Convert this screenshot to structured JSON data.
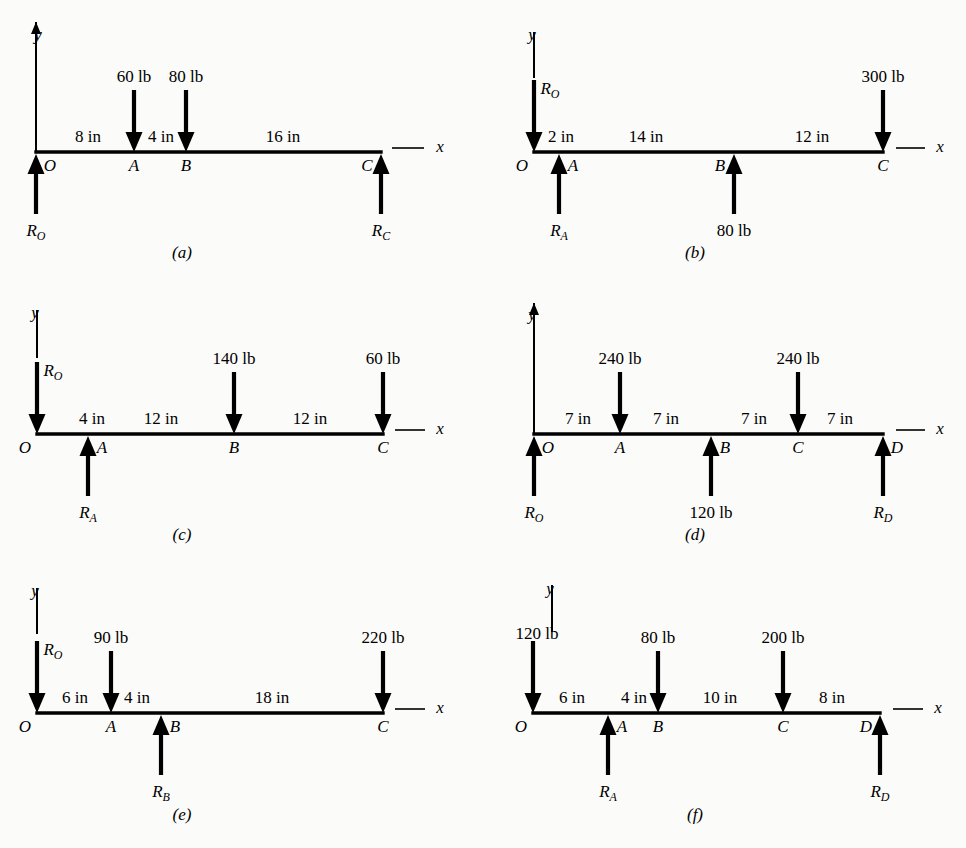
{
  "figure": {
    "type": "free-body-diagram-set",
    "ink_color": "#000000",
    "paper_color": "#fbfbf9"
  },
  "axis_labels": {
    "y": "y",
    "x": "x"
  },
  "units": {
    "length": "in",
    "force": "lb"
  },
  "panels": [
    {
      "caption": "(a)",
      "y_axis_style": "solid",
      "points": [
        "O",
        "A",
        "B",
        "C"
      ],
      "dimensions": [
        "8 in",
        "4 in",
        "16 in"
      ],
      "forces": [
        {
          "at": "O",
          "label": "R",
          "sub": "O",
          "dir": "up",
          "kind": "reaction"
        },
        {
          "at": "A",
          "label": "60 lb",
          "dir": "down",
          "kind": "load"
        },
        {
          "at": "B",
          "label": "80 lb",
          "dir": "down",
          "kind": "load"
        },
        {
          "at": "C",
          "label": "R",
          "sub": "C",
          "dir": "up",
          "kind": "reaction"
        }
      ]
    },
    {
      "caption": "(b)",
      "y_axis_style": "broken",
      "points": [
        "O",
        "A",
        "B",
        "C"
      ],
      "dimensions": [
        "2 in",
        "14 in",
        "12 in"
      ],
      "forces": [
        {
          "at": "O",
          "label": "R",
          "sub": "O",
          "dir": "down",
          "kind": "reaction"
        },
        {
          "at": "A",
          "label": "R",
          "sub": "A",
          "dir": "up",
          "kind": "reaction"
        },
        {
          "at": "B",
          "label": "80 lb",
          "dir": "up",
          "kind": "load"
        },
        {
          "at": "C",
          "label": "300 lb",
          "dir": "down",
          "kind": "load"
        }
      ]
    },
    {
      "caption": "(c)",
      "y_axis_style": "broken",
      "points": [
        "O",
        "A",
        "B",
        "C"
      ],
      "dimensions": [
        "4 in",
        "12 in",
        "12 in"
      ],
      "forces": [
        {
          "at": "O",
          "label": "R",
          "sub": "O",
          "dir": "down",
          "kind": "reaction"
        },
        {
          "at": "A",
          "label": "R",
          "sub": "A",
          "dir": "up",
          "kind": "reaction"
        },
        {
          "at": "B",
          "label": "140 lb",
          "dir": "down",
          "kind": "load"
        },
        {
          "at": "C",
          "label": "60 lb",
          "dir": "down",
          "kind": "load"
        }
      ]
    },
    {
      "caption": "(d)",
      "y_axis_style": "solid",
      "points": [
        "O",
        "A",
        "B",
        "C",
        "D"
      ],
      "dimensions": [
        "7 in",
        "7 in",
        "7 in",
        "7 in"
      ],
      "forces": [
        {
          "at": "O",
          "label": "R",
          "sub": "O",
          "dir": "up",
          "kind": "reaction"
        },
        {
          "at": "A",
          "label": "240 lb",
          "dir": "down",
          "kind": "load"
        },
        {
          "at": "B",
          "label": "120 lb",
          "dir": "up",
          "kind": "load"
        },
        {
          "at": "C",
          "label": "240 lb",
          "dir": "down",
          "kind": "load"
        },
        {
          "at": "D",
          "label": "R",
          "sub": "D",
          "dir": "up",
          "kind": "reaction"
        }
      ]
    },
    {
      "caption": "(e)",
      "y_axis_style": "broken",
      "points": [
        "O",
        "A",
        "B",
        "C"
      ],
      "dimensions": [
        "6 in",
        "4 in",
        "18 in"
      ],
      "forces": [
        {
          "at": "O",
          "label": "R",
          "sub": "O",
          "dir": "down",
          "kind": "reaction"
        },
        {
          "at": "A",
          "label": "90 lb",
          "dir": "down",
          "kind": "load"
        },
        {
          "at": "B",
          "label": "R",
          "sub": "B",
          "dir": "up",
          "kind": "reaction"
        },
        {
          "at": "C",
          "label": "220 lb",
          "dir": "down",
          "kind": "load"
        }
      ]
    },
    {
      "caption": "(f)",
      "y_axis_style": "broken",
      "points": [
        "O",
        "A",
        "B",
        "C",
        "D"
      ],
      "dimensions": [
        "6 in",
        "4 in",
        "10 in",
        "8 in"
      ],
      "forces": [
        {
          "at": "O",
          "label": "120 lb",
          "dir": "down",
          "kind": "load"
        },
        {
          "at": "A",
          "label": "R",
          "sub": "A",
          "dir": "up",
          "kind": "reaction"
        },
        {
          "at": "B",
          "label": "80 lb",
          "dir": "down",
          "kind": "load"
        },
        {
          "at": "C",
          "label": "200 lb",
          "dir": "down",
          "kind": "load"
        },
        {
          "at": "D",
          "label": "R",
          "sub": "D",
          "dir": "up",
          "kind": "reaction"
        }
      ]
    }
  ],
  "geometry": {
    "panel_a": {
      "baseline": 152,
      "x0": 36,
      "x1": 381,
      "pts": [
        {
          "n": "O",
          "x": 36
        },
        {
          "n": "A",
          "x": 134
        },
        {
          "n": "B",
          "x": 186
        },
        {
          "n": "C",
          "x": 381
        }
      ],
      "dims": [
        {
          "t": "8 in",
          "x": 88
        },
        {
          "t": "4 in",
          "x": 161
        },
        {
          "t": "16 in",
          "x": 283
        }
      ],
      "yaxis": {
        "x": 36,
        "top": 22,
        "bot": 152,
        "tip": true,
        "label_x": 38,
        "label_y": 40
      },
      "xdash": {
        "x1": 392,
        "x2": 424,
        "label_x": 440
      },
      "caption_x": 182,
      "caption_y": 258
    },
    "panel_b": {
      "baseline": 152,
      "x0": 534,
      "x1": 883,
      "pts": [
        {
          "n": "O",
          "x": 534
        },
        {
          "n": "A",
          "x": 559
        },
        {
          "n": "B",
          "x": 734
        },
        {
          "n": "C",
          "x": 883
        }
      ],
      "dims": [
        {
          "t": "2 in",
          "x": 561
        },
        {
          "t": "14 in",
          "x": 646
        },
        {
          "t": "12 in",
          "x": 812
        }
      ],
      "yaxis": {
        "x": 534,
        "top": 32,
        "bot": 78,
        "tip": false,
        "label_x": 532,
        "label_y": 40
      },
      "xdash": {
        "x1": 896,
        "x2": 925,
        "label_x": 940
      },
      "caption_x": 695,
      "caption_y": 258
    },
    "panel_c": {
      "baseline": 434,
      "x0": 37,
      "x1": 383,
      "pts": [
        {
          "n": "O",
          "x": 37
        },
        {
          "n": "A",
          "x": 88
        },
        {
          "n": "B",
          "x": 234
        },
        {
          "n": "C",
          "x": 383
        }
      ],
      "dims": [
        {
          "t": "4 in",
          "x": 92
        },
        {
          "t": "12 in",
          "x": 161
        },
        {
          "t": "12 in",
          "x": 310
        }
      ],
      "yaxis": {
        "x": 37,
        "top": 310,
        "bot": 358,
        "tip": false,
        "label_x": 35,
        "label_y": 318
      },
      "xdash": {
        "x1": 395,
        "x2": 425,
        "label_x": 440
      },
      "caption_x": 182,
      "caption_y": 540
    },
    "panel_d": {
      "baseline": 434,
      "x0": 534,
      "x1": 883,
      "pts": [
        {
          "n": "O",
          "x": 534
        },
        {
          "n": "A",
          "x": 620
        },
        {
          "n": "B",
          "x": 711
        },
        {
          "n": "C",
          "x": 798
        },
        {
          "n": "D",
          "x": 883
        }
      ],
      "dims": [
        {
          "t": "7 in",
          "x": 578
        },
        {
          "t": "7 in",
          "x": 666
        },
        {
          "t": "7 in",
          "x": 754
        },
        {
          "t": "7 in",
          "x": 840
        }
      ],
      "yaxis": {
        "x": 534,
        "top": 303,
        "bot": 434,
        "tip": true,
        "label_x": 532,
        "label_y": 320
      },
      "xdash": {
        "x1": 896,
        "x2": 925,
        "label_x": 940
      },
      "caption_x": 695,
      "caption_y": 540
    },
    "panel_e": {
      "baseline": 713,
      "x0": 37,
      "x1": 383,
      "pts": [
        {
          "n": "O",
          "x": 37
        },
        {
          "n": "A",
          "x": 111
        },
        {
          "n": "B",
          "x": 161
        },
        {
          "n": "C",
          "x": 383
        }
      ],
      "dims": [
        {
          "t": "6 in",
          "x": 75
        },
        {
          "t": "4 in",
          "x": 137
        },
        {
          "t": "18 in",
          "x": 272
        }
      ],
      "yaxis": {
        "x": 37,
        "top": 588,
        "bot": 634,
        "tip": false,
        "label_x": 35,
        "label_y": 596
      },
      "xdash": {
        "x1": 395,
        "x2": 425,
        "label_x": 440
      },
      "caption_x": 182,
      "caption_y": 820
    },
    "panel_f": {
      "baseline": 713,
      "x0": 533,
      "x1": 880,
      "pts": [
        {
          "n": "O",
          "x": 533
        },
        {
          "n": "A",
          "x": 608
        },
        {
          "n": "B",
          "x": 658
        },
        {
          "n": "C",
          "x": 783
        },
        {
          "n": "D",
          "x": 880
        }
      ],
      "dims": [
        {
          "t": "6 in",
          "x": 572
        },
        {
          "t": "4 in",
          "x": 634
        },
        {
          "t": "10 in",
          "x": 720
        },
        {
          "t": "8 in",
          "x": 832
        }
      ],
      "yaxis": {
        "x": 552,
        "top": 585,
        "bot": 632,
        "tip": false,
        "label_x": 550,
        "label_y": 594
      },
      "xdash": {
        "x1": 893,
        "x2": 923,
        "label_x": 938
      },
      "caption_x": 695,
      "caption_y": 820
    }
  }
}
